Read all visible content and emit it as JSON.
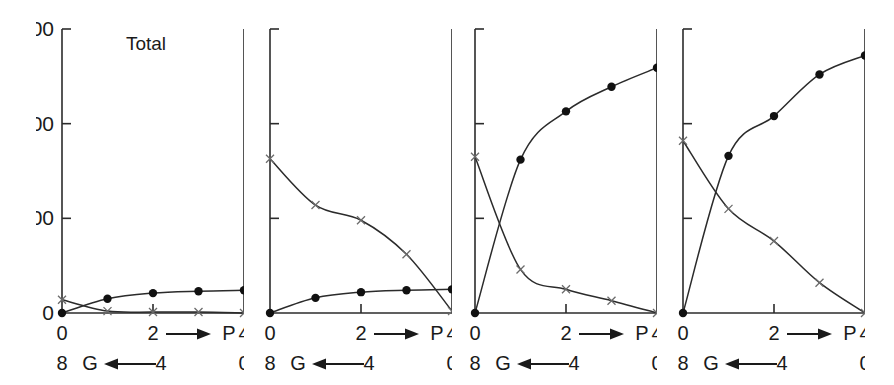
{
  "figure": {
    "title": "Total",
    "width": 894,
    "height": 385,
    "background": "#ffffff",
    "line_color": "#2b2b2b",
    "dot_color": "#111111",
    "cross_color": "#6b6b6b"
  },
  "axes": {
    "y_ticks": [
      "0",
      "100",
      "200",
      "300"
    ],
    "y_tick_values": [
      0,
      100,
      200,
      300
    ],
    "y_min": 0,
    "y_max": 300,
    "y_label_visible_on_panel": 1,
    "x_top_ticks": [
      "0",
      "2",
      "4"
    ],
    "x_top_tick_values": [
      0,
      2,
      4
    ],
    "x_top_letter": "P",
    "x_top_arrow": "right",
    "x_bottom_ticks": [
      "8",
      "4",
      "0"
    ],
    "x_bottom_tick_values": [
      8,
      4,
      0
    ],
    "x_bottom_letter": "G",
    "x_bottom_arrow": "left",
    "x_min": 0,
    "x_max": 4
  },
  "chart_data": {
    "type": "line",
    "title": "Total",
    "xlabel": "P (0→4) / G (8←0)",
    "ylabel": "Total",
    "xlim": [
      0,
      4
    ],
    "ylim": [
      0,
      300
    ],
    "grid": false,
    "legend": "none",
    "x": [
      0,
      1,
      2,
      3,
      4
    ],
    "panels": [
      {
        "index": 1,
        "label": "Total",
        "series": [
          {
            "name": "filled-circle",
            "marker": "circle",
            "values": [
              0,
              15,
              21,
              23,
              24
            ],
            "marker_x": [
              0,
              1,
              2,
              3,
              4
            ]
          },
          {
            "name": "cross",
            "marker": "x",
            "values": [
              14,
              2,
              1,
              1,
              0
            ],
            "marker_x": [
              0,
              1,
              2,
              3,
              4
            ]
          }
        ]
      },
      {
        "index": 2,
        "label": "",
        "series": [
          {
            "name": "filled-circle",
            "marker": "circle",
            "values": [
              0,
              16,
              22,
              24,
              25
            ],
            "marker_x": [
              0,
              1,
              2,
              3,
              4
            ]
          },
          {
            "name": "cross",
            "marker": "x",
            "values": [
              163,
              114,
              98,
              62,
              2
            ],
            "marker_x": [
              0,
              1,
              2,
              3,
              4
            ]
          }
        ]
      },
      {
        "index": 3,
        "label": "",
        "series": [
          {
            "name": "filled-circle",
            "marker": "circle",
            "values": [
              0,
              162,
              213,
              239,
              259
            ],
            "marker_x": [
              0,
              1,
              2,
              3,
              4
            ]
          },
          {
            "name": "cross",
            "marker": "x",
            "values": [
              165,
              46,
              25,
              13,
              0
            ],
            "marker_x": [
              0,
              1,
              2,
              3,
              4
            ]
          }
        ]
      },
      {
        "index": 4,
        "label": "",
        "series": [
          {
            "name": "filled-circle",
            "marker": "circle",
            "values": [
              0,
              166,
              208,
              252,
              272
            ],
            "marker_x": [
              0,
              1,
              2,
              3,
              4
            ]
          },
          {
            "name": "cross",
            "marker": "x",
            "values": [
              182,
              110,
              76,
              32,
              0
            ],
            "marker_x": [
              0,
              1,
              2,
              3,
              4
            ]
          }
        ]
      }
    ]
  }
}
